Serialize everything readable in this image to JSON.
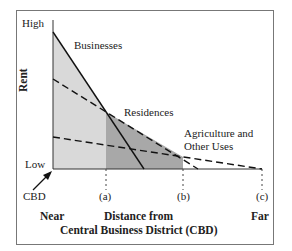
{
  "diagram": {
    "ylabel": "Rent",
    "y_high": "High",
    "y_low": "Low",
    "origin_label": "CBD",
    "curves": [
      {
        "name": "Businesses",
        "style": "solid"
      },
      {
        "name": "Residences",
        "style": "dashed"
      },
      {
        "name": "Agriculture and",
        "name2": "Other Uses",
        "style": "dashed"
      }
    ],
    "ticks": [
      "(a)",
      "(b)",
      "(c)"
    ],
    "x_near": "Near",
    "x_far": "Far",
    "xlabel_line1": "Distance from",
    "xlabel_line2": "Central Business District (CBD)",
    "colors": {
      "zone1": "#d8d8d8",
      "zone2": "#a9a9a9",
      "line": "#111111"
    }
  }
}
